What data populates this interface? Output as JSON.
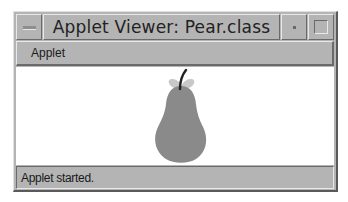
{
  "window": {
    "title": "Applet Viewer: Pear.class",
    "buttons": {
      "window_menu": "window-menu-icon",
      "minimize": "minimize-icon",
      "maximize": "maximize-icon"
    }
  },
  "menubar": {
    "items": [
      {
        "label": "Applet"
      }
    ]
  },
  "applet": {
    "drawing": "pear",
    "colors": {
      "pear_body": "#8a8a8a",
      "leaves": "#c8c8c8",
      "stem": "#222222",
      "background": "#ffffff"
    }
  },
  "status": {
    "text": "Applet started."
  }
}
